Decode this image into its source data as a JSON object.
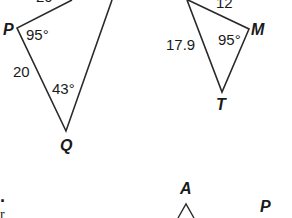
{
  "figure": {
    "stroke_color": "#2a2a2a",
    "text_color": "#1a1a1a",
    "background": "#ffffff",
    "triangle_left": {
      "vertices": {
        "P": "P",
        "Q": "Q"
      },
      "angle_P": "95°",
      "angle_Q": "43°",
      "side_PQ": "20",
      "cut_top_label": "20°"
    },
    "triangle_right": {
      "vertices": {
        "M": "M",
        "T": "T"
      },
      "angle_M": "95°",
      "side_top": "12",
      "side_left": "17.9"
    },
    "bottom_figure": {
      "vertex_A": "A",
      "vertex_P": "P"
    },
    "left_margin_marks": {
      "dot": "·",
      "partial_char": "r"
    }
  }
}
